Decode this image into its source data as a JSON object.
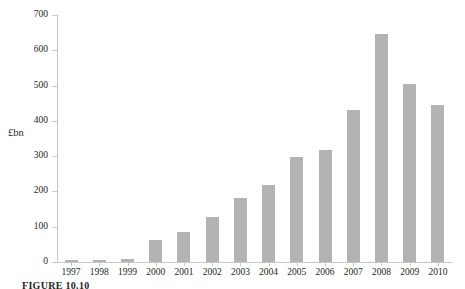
{
  "figure": {
    "caption": "FIGURE 10.10"
  },
  "chart_data": {
    "type": "bar",
    "title": "",
    "subtitle": "",
    "xlabel": "",
    "ylabel": "£bn",
    "categories": [
      "1997",
      "1998",
      "1999",
      "2000",
      "2001",
      "2002",
      "2003",
      "2004",
      "2005",
      "2006",
      "2007",
      "2008",
      "2009",
      "2010"
    ],
    "values": [
      5,
      7,
      8,
      62,
      85,
      128,
      180,
      218,
      297,
      318,
      430,
      645,
      505,
      445
    ],
    "series": [
      {
        "name": "",
        "values": [
          5,
          7,
          8,
          62,
          85,
          128,
          180,
          218,
          297,
          318,
          430,
          645,
          505,
          445
        ]
      }
    ],
    "ylim": [
      0,
      700
    ],
    "ytick_labels": [
      "0",
      "100",
      "200",
      "300",
      "400",
      "500",
      "600",
      "700"
    ],
    "ytick_values": [
      0,
      100,
      200,
      300,
      400,
      500,
      600,
      700
    ],
    "grid": false,
    "legend": "none",
    "bar_color": "#b3b3b3",
    "axis_color": "#c9c9c9",
    "text_color": "#231f20"
  }
}
